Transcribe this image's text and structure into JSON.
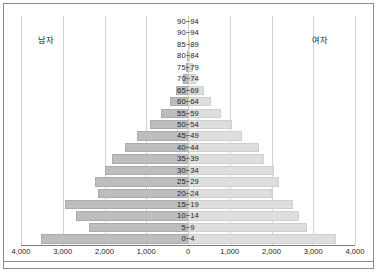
{
  "figure": {
    "left_series_label": "남자",
    "right_series_label": "여자"
  },
  "chart_data": {
    "type": "bar",
    "subtype": "population-pyramid",
    "orientation": "horizontal-diverging",
    "title": "",
    "xlabel": "",
    "ylabel": "",
    "grid": true,
    "legend_position": "in-plot-top-corners",
    "axis_unit_step": 1000,
    "xlim": [
      -4000,
      4000
    ],
    "xtick_values": [
      -4000,
      -3000,
      -2000,
      -1000,
      0,
      1000,
      2000,
      3000,
      4000
    ],
    "xtick_labels": [
      "4,000",
      "3,000",
      "2,000",
      "1,000",
      "0",
      "1,000",
      "2,000",
      "3,000",
      "4,000"
    ],
    "categories": [
      "90~94",
      "90~94",
      "85~89",
      "80~84",
      "75~79",
      "70~74",
      "65~69",
      "60~64",
      "55~59",
      "50~54",
      "45~49",
      "40~44",
      "35~39",
      "30~34",
      "25~29",
      "20~24",
      "15~19",
      "10~14",
      "5~9",
      "0~4"
    ],
    "series": [
      {
        "name": "남자",
        "side": "left",
        "color": "#bdbdbd",
        "values": [
          0,
          0,
          10,
          20,
          40,
          110,
          290,
          420,
          640,
          900,
          1230,
          1510,
          1830,
          1980,
          2230,
          2160,
          2950,
          2680,
          2380,
          3530
        ]
      },
      {
        "name": "여자",
        "side": "right",
        "color": "#dedede",
        "values": [
          0,
          0,
          15,
          55,
          110,
          190,
          390,
          560,
          800,
          1060,
          1290,
          1700,
          1810,
          2070,
          2190,
          2010,
          2520,
          2650,
          2840,
          3550
        ]
      }
    ]
  }
}
